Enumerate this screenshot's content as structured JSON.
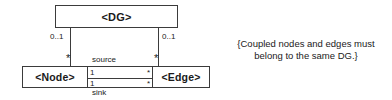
{
  "diagram": {
    "type": "uml-class-diagram",
    "classes": {
      "dg": {
        "name": "<DG>"
      },
      "node": {
        "name": "<Node>"
      },
      "edge": {
        "name": "<Edge>"
      }
    },
    "multiplicities": {
      "dg_to_node": "0..1",
      "dg_to_edge": "0..1",
      "node_end_star": "*",
      "edge_end_star": "*",
      "source_node_end": "1",
      "source_edge_end": "*",
      "sink_node_end": "1",
      "sink_edge_end": "*"
    },
    "association_roles": {
      "source": "source",
      "sink": "sink"
    },
    "note": {
      "line1": "{Coupled nodes and edges must",
      "line2": "belong to the same DG.}"
    },
    "colors": {
      "stroke": "#3b3b3b",
      "text": "#1a1a1a",
      "background": "#ffffff"
    }
  }
}
